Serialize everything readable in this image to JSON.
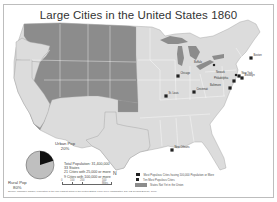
{
  "title": "Large Cities in the United States 1860",
  "colors": {
    "states_in_union": "#dcdcdc",
    "territories_not_in_union": "#8c8c8c",
    "lakes": "#8c8c8c",
    "borders": "#ffffff",
    "city_marker": "#222222",
    "pie_urban": "#111111",
    "pie_rural": "#bfbfbf"
  },
  "pie": {
    "urban_label": "Urban Pop",
    "urban_value": "20%",
    "rural_label": "Rural Pop",
    "rural_value": "80%",
    "urban_fraction": 0.2
  },
  "stats": [
    "Total Population: 31,400,000",
    "33 States",
    "21 Cities with 25,000 or more",
    "9 Cities with 100,000 or more"
  ],
  "scale": {
    "ticks": [
      "0",
      "100",
      "200",
      "500 Miles"
    ]
  },
  "north_arrow": "N",
  "legend": [
    {
      "symbol": "large-dot",
      "label": "Most Populous Cities having 100,000 Population or More"
    },
    {
      "symbol": "small-dot",
      "label": "Ten Most Populous Cities"
    },
    {
      "symbol": "gray-swatch",
      "label": "States Not Yet in the Union"
    }
  ],
  "source": "Source: Campbell Gibson, Population of the 100 Largest Cities in the United States: 1790-1990 (Washington, DC: US Census Bureau, 1998)",
  "side_credit": "Map by Geography Department",
  "cities": [
    {
      "name": "Boston",
      "size": "large"
    },
    {
      "name": "New York",
      "size": "large"
    },
    {
      "name": "Brooklyn",
      "size": "large"
    },
    {
      "name": "Philadelphia",
      "size": "large"
    },
    {
      "name": "Baltimore",
      "size": "large"
    },
    {
      "name": "Buffalo",
      "size": "small"
    },
    {
      "name": "Newark",
      "size": "small"
    },
    {
      "name": "Chicago",
      "size": "large"
    },
    {
      "name": "Cincinnati",
      "size": "large"
    },
    {
      "name": "St. Louis",
      "size": "large"
    },
    {
      "name": "New Orleans",
      "size": "large"
    }
  ]
}
